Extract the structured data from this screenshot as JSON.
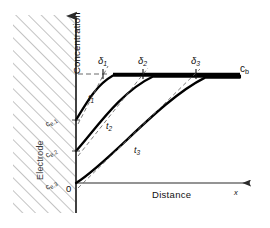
{
  "figure": {
    "type": "concentration-profile-diagram",
    "axes": {
      "y_label": "Concentration",
      "x_label": "Distance",
      "x_variable": "x",
      "origin_label": "0"
    },
    "region": {
      "electrode_label": "Electrode",
      "hatch_color": "#8a8a8a"
    },
    "bulk": {
      "label": "c",
      "subscript": "b",
      "level_y": 74
    },
    "curves": [
      {
        "time_label": "t",
        "time_sub": "1",
        "surface_label": "c",
        "surface_sub": "e,1",
        "delta_label": "δ",
        "delta_sub": "1",
        "surface_y": 120,
        "delta_x": 103,
        "color": "#000000"
      },
      {
        "time_label": "t",
        "time_sub": "2",
        "surface_label": "c",
        "surface_sub": "e,2",
        "delta_label": "δ",
        "delta_sub": "2",
        "surface_y": 151,
        "delta_x": 143,
        "color": "#000000"
      },
      {
        "time_label": "t",
        "time_sub": "3",
        "surface_label": "c",
        "surface_sub": "e,3",
        "delta_label": "δ",
        "delta_sub": "3",
        "surface_y": 183,
        "delta_x": 196,
        "color": "#000000"
      }
    ],
    "colors": {
      "line": "#000000",
      "axis": "#2b2b2b",
      "dashed": "#6b6b6b"
    }
  }
}
